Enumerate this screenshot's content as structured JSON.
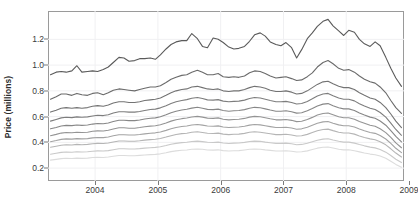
{
  "chart_data": {
    "type": "line",
    "title": "",
    "subtitle": "",
    "xlabel": "",
    "ylabel": "Price (millions)",
    "xlim": [
      2003.25,
      2008.92
    ],
    "ylim": [
      0.1,
      1.42
    ],
    "xticks": [
      2004,
      2005,
      2006,
      2007,
      2008,
      2009
    ],
    "xticklabels": [
      "2004",
      "2005",
      "2006",
      "2007",
      "2008",
      "2009"
    ],
    "yticks": [
      0.2,
      0.4,
      0.6,
      0.8,
      1.0,
      1.2
    ],
    "yticklabels": [
      "0.2",
      "0.4",
      "0.6",
      "0.8",
      "1.0",
      "1.2"
    ],
    "grid": true,
    "grid_axis": "both",
    "legend": "none",
    "x": [
      2003.29,
      2003.38,
      2003.46,
      2003.54,
      2003.63,
      2003.71,
      2003.79,
      2003.88,
      2003.96,
      2004.04,
      2004.13,
      2004.21,
      2004.29,
      2004.38,
      2004.46,
      2004.54,
      2004.63,
      2004.71,
      2004.79,
      2004.88,
      2004.96,
      2005.04,
      2005.13,
      2005.21,
      2005.29,
      2005.38,
      2005.46,
      2005.54,
      2005.63,
      2005.71,
      2005.79,
      2005.88,
      2005.96,
      2006.04,
      2006.13,
      2006.21,
      2006.29,
      2006.38,
      2006.46,
      2006.54,
      2006.63,
      2006.71,
      2006.79,
      2006.88,
      2006.96,
      2007.04,
      2007.13,
      2007.21,
      2007.29,
      2007.38,
      2007.46,
      2007.54,
      2007.63,
      2007.71,
      2007.79,
      2007.88,
      2007.96,
      2008.04,
      2008.13,
      2008.21,
      2008.29,
      2008.38,
      2008.46,
      2008.54,
      2008.63,
      2008.71,
      2008.79,
      2008.88
    ],
    "series": [
      {
        "name": "q90",
        "color": "#5a5a5a",
        "values": [
          0.925,
          0.945,
          0.95,
          0.945,
          0.955,
          0.995,
          0.945,
          0.95,
          0.955,
          0.95,
          0.965,
          0.985,
          1.02,
          1.06,
          1.055,
          1.03,
          1.035,
          1.05,
          1.05,
          1.055,
          1.045,
          1.08,
          1.125,
          1.16,
          1.18,
          1.19,
          1.19,
          1.245,
          1.205,
          1.145,
          1.135,
          1.21,
          1.2,
          1.175,
          1.14,
          1.125,
          1.13,
          1.145,
          1.185,
          1.235,
          1.25,
          1.225,
          1.18,
          1.16,
          1.15,
          1.175,
          1.135,
          1.055,
          1.12,
          1.205,
          1.25,
          1.3,
          1.34,
          1.355,
          1.305,
          1.265,
          1.23,
          1.27,
          1.255,
          1.2,
          1.165,
          1.145,
          1.18,
          1.15,
          1.06,
          0.975,
          0.9,
          0.835
        ]
      },
      {
        "name": "q80",
        "color": "#6a6a6a",
        "values": [
          0.735,
          0.755,
          0.775,
          0.775,
          0.765,
          0.78,
          0.77,
          0.765,
          0.78,
          0.785,
          0.77,
          0.785,
          0.805,
          0.815,
          0.81,
          0.805,
          0.8,
          0.81,
          0.82,
          0.83,
          0.83,
          0.84,
          0.865,
          0.89,
          0.905,
          0.92,
          0.925,
          0.945,
          0.96,
          0.945,
          0.925,
          0.925,
          0.935,
          0.91,
          0.905,
          0.91,
          0.905,
          0.915,
          0.94,
          0.955,
          0.95,
          0.935,
          0.915,
          0.9,
          0.905,
          0.91,
          0.895,
          0.88,
          0.885,
          0.91,
          0.94,
          0.985,
          1.02,
          1.035,
          1.01,
          0.975,
          0.96,
          0.965,
          0.945,
          0.915,
          0.89,
          0.87,
          0.86,
          0.83,
          0.785,
          0.725,
          0.67,
          0.625
        ]
      },
      {
        "name": "q70",
        "color": "#737373",
        "values": [
          0.635,
          0.65,
          0.665,
          0.67,
          0.665,
          0.67,
          0.665,
          0.67,
          0.68,
          0.685,
          0.68,
          0.69,
          0.705,
          0.715,
          0.715,
          0.71,
          0.71,
          0.715,
          0.725,
          0.73,
          0.735,
          0.745,
          0.765,
          0.785,
          0.8,
          0.81,
          0.815,
          0.83,
          0.835,
          0.825,
          0.815,
          0.81,
          0.815,
          0.8,
          0.795,
          0.8,
          0.8,
          0.81,
          0.825,
          0.835,
          0.83,
          0.82,
          0.805,
          0.795,
          0.795,
          0.8,
          0.79,
          0.775,
          0.78,
          0.8,
          0.825,
          0.85,
          0.87,
          0.875,
          0.855,
          0.835,
          0.825,
          0.825,
          0.81,
          0.785,
          0.765,
          0.745,
          0.735,
          0.71,
          0.67,
          0.62,
          0.565,
          0.515
        ]
      },
      {
        "name": "q60",
        "color": "#7d7d7d",
        "values": [
          0.565,
          0.578,
          0.59,
          0.595,
          0.592,
          0.598,
          0.595,
          0.598,
          0.605,
          0.61,
          0.608,
          0.615,
          0.628,
          0.638,
          0.638,
          0.635,
          0.635,
          0.64,
          0.648,
          0.655,
          0.658,
          0.668,
          0.685,
          0.702,
          0.715,
          0.725,
          0.732,
          0.742,
          0.748,
          0.74,
          0.73,
          0.728,
          0.732,
          0.72,
          0.715,
          0.718,
          0.72,
          0.728,
          0.74,
          0.748,
          0.745,
          0.735,
          0.725,
          0.715,
          0.715,
          0.718,
          0.71,
          0.698,
          0.702,
          0.718,
          0.738,
          0.76,
          0.775,
          0.78,
          0.762,
          0.745,
          0.735,
          0.735,
          0.722,
          0.7,
          0.682,
          0.665,
          0.655,
          0.632,
          0.596,
          0.55,
          0.5,
          0.455
        ]
      },
      {
        "name": "q50",
        "color": "#878787",
        "values": [
          0.505,
          0.516,
          0.527,
          0.532,
          0.53,
          0.535,
          0.532,
          0.535,
          0.542,
          0.546,
          0.544,
          0.551,
          0.562,
          0.572,
          0.572,
          0.569,
          0.569,
          0.574,
          0.581,
          0.587,
          0.59,
          0.599,
          0.614,
          0.63,
          0.642,
          0.651,
          0.657,
          0.666,
          0.672,
          0.665,
          0.656,
          0.654,
          0.658,
          0.647,
          0.642,
          0.645,
          0.647,
          0.654,
          0.665,
          0.672,
          0.669,
          0.66,
          0.651,
          0.642,
          0.642,
          0.645,
          0.638,
          0.627,
          0.63,
          0.645,
          0.663,
          0.683,
          0.697,
          0.701,
          0.685,
          0.669,
          0.66,
          0.66,
          0.648,
          0.628,
          0.612,
          0.596,
          0.587,
          0.566,
          0.533,
          0.491,
          0.446,
          0.404
        ]
      },
      {
        "name": "q40",
        "color": "#949494",
        "values": [
          0.452,
          0.462,
          0.472,
          0.477,
          0.475,
          0.479,
          0.477,
          0.479,
          0.486,
          0.489,
          0.488,
          0.494,
          0.504,
          0.513,
          0.513,
          0.51,
          0.51,
          0.515,
          0.521,
          0.526,
          0.529,
          0.537,
          0.551,
          0.565,
          0.576,
          0.584,
          0.589,
          0.597,
          0.602,
          0.596,
          0.588,
          0.586,
          0.59,
          0.58,
          0.575,
          0.578,
          0.58,
          0.586,
          0.596,
          0.602,
          0.599,
          0.591,
          0.583,
          0.575,
          0.575,
          0.578,
          0.571,
          0.561,
          0.564,
          0.578,
          0.594,
          0.612,
          0.624,
          0.628,
          0.614,
          0.599,
          0.591,
          0.591,
          0.58,
          0.562,
          0.548,
          0.533,
          0.525,
          0.506,
          0.476,
          0.438,
          0.396,
          0.358
        ]
      },
      {
        "name": "q30",
        "color": "#a3a3a3",
        "values": [
          0.405,
          0.414,
          0.423,
          0.427,
          0.425,
          0.429,
          0.427,
          0.429,
          0.435,
          0.438,
          0.437,
          0.442,
          0.451,
          0.459,
          0.459,
          0.457,
          0.457,
          0.461,
          0.466,
          0.471,
          0.474,
          0.481,
          0.493,
          0.506,
          0.516,
          0.523,
          0.527,
          0.535,
          0.539,
          0.534,
          0.527,
          0.525,
          0.528,
          0.519,
          0.515,
          0.517,
          0.519,
          0.525,
          0.534,
          0.539,
          0.536,
          0.529,
          0.522,
          0.515,
          0.515,
          0.517,
          0.511,
          0.502,
          0.505,
          0.517,
          0.532,
          0.548,
          0.559,
          0.562,
          0.549,
          0.536,
          0.529,
          0.529,
          0.519,
          0.503,
          0.49,
          0.477,
          0.47,
          0.453,
          0.426,
          0.392,
          0.354,
          0.32
        ]
      },
      {
        "name": "q20",
        "color": "#b5b5b5",
        "values": [
          0.362,
          0.37,
          0.378,
          0.382,
          0.38,
          0.384,
          0.382,
          0.384,
          0.389,
          0.392,
          0.391,
          0.395,
          0.403,
          0.411,
          0.411,
          0.409,
          0.409,
          0.412,
          0.417,
          0.421,
          0.424,
          0.43,
          0.441,
          0.452,
          0.461,
          0.468,
          0.471,
          0.478,
          0.482,
          0.477,
          0.471,
          0.469,
          0.472,
          0.464,
          0.46,
          0.463,
          0.464,
          0.47,
          0.478,
          0.482,
          0.479,
          0.473,
          0.467,
          0.46,
          0.46,
          0.463,
          0.457,
          0.449,
          0.451,
          0.462,
          0.476,
          0.49,
          0.5,
          0.503,
          0.491,
          0.479,
          0.473,
          0.473,
          0.464,
          0.45,
          0.438,
          0.427,
          0.42,
          0.405,
          0.381,
          0.35,
          0.317,
          0.286
        ]
      },
      {
        "name": "q10",
        "color": "#c9c9c9",
        "values": [
          0.308,
          0.315,
          0.322,
          0.325,
          0.323,
          0.327,
          0.325,
          0.327,
          0.331,
          0.334,
          0.333,
          0.336,
          0.343,
          0.35,
          0.35,
          0.348,
          0.348,
          0.351,
          0.355,
          0.358,
          0.361,
          0.366,
          0.375,
          0.385,
          0.392,
          0.398,
          0.401,
          0.407,
          0.41,
          0.406,
          0.401,
          0.399,
          0.402,
          0.395,
          0.391,
          0.394,
          0.395,
          0.4,
          0.407,
          0.41,
          0.408,
          0.402,
          0.397,
          0.392,
          0.392,
          0.394,
          0.389,
          0.382,
          0.384,
          0.393,
          0.405,
          0.417,
          0.425,
          0.428,
          0.418,
          0.408,
          0.402,
          0.402,
          0.394,
          0.383,
          0.373,
          0.363,
          0.357,
          0.345,
          0.324,
          0.298,
          0.269,
          0.243
        ]
      },
      {
        "name": "q05",
        "color": "#dcdcdc",
        "values": [
          0.262,
          0.268,
          0.274,
          0.277,
          0.275,
          0.278,
          0.276,
          0.278,
          0.282,
          0.284,
          0.283,
          0.286,
          0.292,
          0.298,
          0.298,
          0.296,
          0.296,
          0.299,
          0.302,
          0.305,
          0.307,
          0.311,
          0.319,
          0.328,
          0.334,
          0.339,
          0.341,
          0.346,
          0.349,
          0.346,
          0.341,
          0.34,
          0.342,
          0.336,
          0.333,
          0.335,
          0.336,
          0.341,
          0.346,
          0.349,
          0.347,
          0.342,
          0.338,
          0.333,
          0.333,
          0.335,
          0.331,
          0.325,
          0.327,
          0.334,
          0.345,
          0.355,
          0.362,
          0.364,
          0.356,
          0.347,
          0.342,
          0.342,
          0.335,
          0.326,
          0.317,
          0.309,
          0.304,
          0.294,
          0.276,
          0.253,
          0.229,
          0.207
        ]
      }
    ]
  }
}
